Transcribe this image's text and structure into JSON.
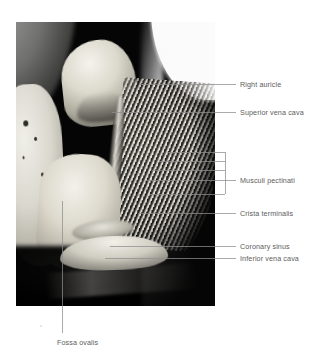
{
  "figure": {
    "kind": "anatomical-photograph",
    "photo": {
      "x": 16,
      "y": 22,
      "width": 199,
      "height": 284,
      "background_color": "#000000"
    },
    "background_color": "#ffffff",
    "leader_color": "#8e8e8e",
    "text_color": "#5d5d5d"
  },
  "labels": [
    {
      "id": "right-auricle",
      "text": "Right auricle",
      "text_x": 240,
      "text_y": 80,
      "leader": {
        "type": "line",
        "x1": 140,
        "y1": 84,
        "x2": 236,
        "y2": 84
      }
    },
    {
      "id": "superior-vena-cava",
      "text": "Superior vena cava",
      "text_x": 240,
      "text_y": 108,
      "leader": {
        "type": "line",
        "x1": 112,
        "y1": 112,
        "x2": 236,
        "y2": 112
      }
    },
    {
      "id": "musculi-pectinati",
      "text": "Musculi pectinati",
      "text_x": 240,
      "text_y": 176,
      "leader": {
        "type": "bracket",
        "spine_x": 225,
        "spine_y1": 152,
        "spine_y2": 194,
        "stub_x2": 236,
        "stub_y": 180,
        "rows": [
          {
            "x1": 168,
            "y": 152
          },
          {
            "x1": 160,
            "y": 161
          },
          {
            "x1": 152,
            "y": 170
          },
          {
            "x1": 146,
            "y": 180
          },
          {
            "x1": 150,
            "y": 194
          }
        ]
      }
    },
    {
      "id": "crista-terminalis",
      "text": "Crista terminalis",
      "text_x": 240,
      "text_y": 209,
      "leader": {
        "type": "line",
        "x1": 138,
        "y1": 213,
        "x2": 236,
        "y2": 213
      }
    },
    {
      "id": "coronary-sinus",
      "text": "Coronary sinus",
      "text_x": 240,
      "text_y": 242,
      "leader": {
        "type": "line",
        "x1": 110,
        "y1": 246,
        "x2": 236,
        "y2": 246
      }
    },
    {
      "id": "inferior-vena-cava",
      "text": "Inferior vena cava",
      "text_x": 240,
      "text_y": 254,
      "leader": {
        "type": "line",
        "x1": 105,
        "y1": 258,
        "x2": 236,
        "y2": 258
      }
    },
    {
      "id": "fossa-ovalis",
      "text": "Fossa ovalis",
      "text_x": 57,
      "text_y": 338,
      "leader": {
        "type": "line",
        "x1": 62,
        "y1": 201,
        "x2": 62,
        "y2": 333
      }
    }
  ],
  "marks": [
    {
      "id": "dust-speck",
      "x": 40,
      "y": 325
    }
  ]
}
